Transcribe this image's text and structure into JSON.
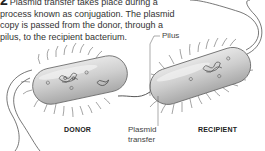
{
  "caption": {
    "step_number": "2",
    "text": "Plasmid transfer takes place during a process known as conjugation. The plasmid copy is passed from the donor, through a pilus, to the recipient bacterium."
  },
  "labels": {
    "pilus": "Pilus",
    "donor": "DONOR",
    "recipient": "RECIPIENT",
    "plasmid_transfer_line1": "Plasmid",
    "plasmid_transfer_line2": "transfer"
  },
  "colors": {
    "cell_fill": "#c8c8c8",
    "cell_highlight": "#eeeeee",
    "outline": "#555555",
    "text": "#333333"
  }
}
